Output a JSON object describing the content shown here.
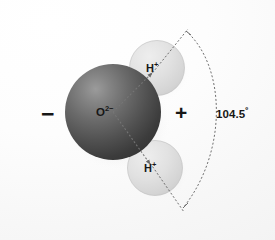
{
  "figure": {
    "type": "molecular-diagram",
    "width": 275,
    "height": 240,
    "background_color": "#fbfbfb"
  },
  "atoms": {
    "oxygen": {
      "label_text": "O",
      "label_superscript": "2−",
      "full_label": "O2−",
      "element": "oxygen",
      "color": "#4a4a4a",
      "highlight_color": "#8e8e8e",
      "cx": 113,
      "cy": 112,
      "r": 48
    },
    "hydrogen_upper": {
      "label_text": "H",
      "label_superscript": "+",
      "full_label": "H+",
      "element": "hydrogen",
      "color": "#d8d8d8",
      "cx": 157,
      "cy": 68,
      "r": 27
    },
    "hydrogen_lower": {
      "label_text": "H",
      "label_superscript": "+",
      "full_label": "H+",
      "element": "hydrogen",
      "color": "#d8d8d8",
      "cx": 155,
      "cy": 168,
      "r": 27
    }
  },
  "charges": {
    "negative": {
      "symbol": "−",
      "side": "left",
      "x": 48,
      "y": 114
    },
    "positive": {
      "symbol": "+",
      "side": "right",
      "x": 182,
      "y": 114
    }
  },
  "angle": {
    "value": "104.5",
    "unit": "º",
    "display": "104.5º",
    "description": "H-O-H bond angle"
  },
  "guides": {
    "bond_line_color": "#6b6b6b",
    "arc_color": "#6b6b6b",
    "dash_pattern": "2 2"
  }
}
